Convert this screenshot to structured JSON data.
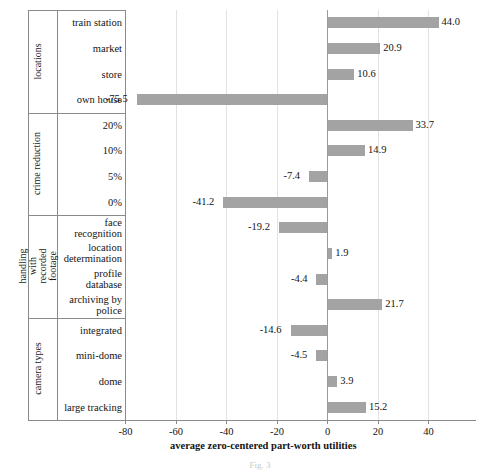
{
  "chart_data": {
    "type": "bar",
    "orientation": "horizontal",
    "title": "",
    "xlabel": "average zero-centered part-worth utilities",
    "ylabel": "",
    "xlim": [
      -90,
      50
    ],
    "xticks": [
      -80,
      -60,
      -40,
      -20,
      0,
      20,
      40
    ],
    "xticklabels": [
      "-80",
      "-60",
      "-40",
      "-20",
      "0",
      "20",
      "40"
    ],
    "grid": true,
    "legend": "none",
    "bar_color": "#a3a3a3",
    "groups": [
      {
        "name": "locations",
        "categories": [
          "train station",
          "market",
          "store",
          "own house"
        ],
        "values": [
          44.0,
          20.9,
          10.6,
          -75.5
        ],
        "labels": [
          "44.0",
          "20.9",
          "10.6",
          "-75.5"
        ]
      },
      {
        "name": "crime reduction",
        "categories": [
          "20%",
          "10%",
          "5%",
          "0%"
        ],
        "values": [
          33.7,
          14.9,
          -7.4,
          -41.2
        ],
        "labels": [
          "33.7",
          "14.9",
          "-7.4",
          "-41.2"
        ]
      },
      {
        "name": "handling with recorded footage",
        "categories": [
          "face recognition",
          "location determination",
          "profile database",
          "archiving by police"
        ],
        "values": [
          -19.2,
          1.9,
          -4.4,
          21.7
        ],
        "labels": [
          "-19.2",
          "1.9",
          "-4.4",
          "21.7"
        ]
      },
      {
        "name": "camera types",
        "categories": [
          "integrated",
          "mini-dome",
          "dome",
          "large tracking"
        ],
        "values": [
          -14.6,
          -4.5,
          3.9,
          15.2
        ],
        "labels": [
          "-14.6",
          "-4.5",
          "3.9",
          "15.2"
        ]
      }
    ]
  },
  "caption": "Fig. 3"
}
